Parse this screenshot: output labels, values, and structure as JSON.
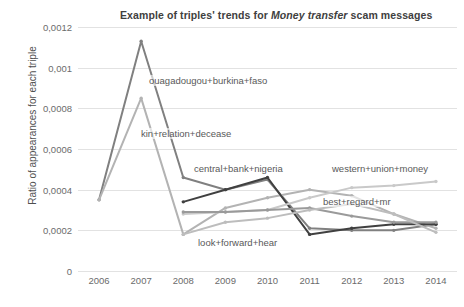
{
  "chart_data": {
    "type": "line",
    "title": "Example of triples' trends for Money transfer scam messages",
    "title_parts": {
      "before": "Example of triples' trends for ",
      "italic": "Money transfer",
      "after": " scam messages"
    },
    "xlabel": "",
    "ylabel": "Ratio of appearances for each triple",
    "categories": [
      "2006",
      "2007",
      "2008",
      "2009",
      "2010",
      "2011",
      "2012",
      "2013",
      "2014"
    ],
    "x": [
      2006,
      2007,
      2008,
      2009,
      2010,
      2011,
      2012,
      2013,
      2014
    ],
    "ylim": [
      0,
      0.0012
    ],
    "ytick_labels": [
      "0",
      "0,0002",
      "0,0004",
      "0,0006",
      "0,0008",
      "0,001",
      "0,0012"
    ],
    "ytick_values": [
      0,
      0.0002,
      0.0004,
      0.0006,
      0.0008,
      0.001,
      0.0012
    ],
    "grid": true,
    "legend_position": "inline-annotations",
    "decimal_separator": ",",
    "series": [
      {
        "name": "ouagadougou+burkina+faso",
        "color": "#808080",
        "label_x": 148,
        "label_y": 75,
        "values": [
          0.00035,
          0.00113,
          0.00046,
          0.0004,
          0.00045,
          0.00021,
          0.0002,
          0.0002,
          0.00023
        ]
      },
      {
        "name": "kin+relation+decease",
        "color": "#b3b3b3",
        "label_x": 140,
        "label_y": 128,
        "values": [
          0.00035,
          0.00085,
          0.00018,
          0.00031,
          0.00036,
          0.0004,
          0.00037,
          0.00028,
          0.00021
        ]
      },
      {
        "name": "central+bank+nigeria",
        "color": "#404040",
        "label_x": 193,
        "label_y": 163,
        "values": [
          null,
          null,
          0.00034,
          0.0004,
          0.00046,
          0.00018,
          0.00021,
          0.00023,
          0.00023
        ]
      },
      {
        "name": "western+union+money",
        "color": "#c9c9c9",
        "label_x": 331,
        "label_y": 163,
        "values": [
          null,
          null,
          0.00028,
          0.00029,
          0.0003,
          0.00036,
          0.00041,
          0.00042,
          0.00044
        ]
      },
      {
        "name": "best+regard+mr",
        "color": "#9a9a9a",
        "label_x": 322,
        "label_y": 196,
        "values": [
          null,
          null,
          0.00029,
          0.00029,
          0.0003,
          0.00031,
          0.00027,
          0.00024,
          0.00024
        ]
      },
      {
        "name": "look+forward+hear",
        "color": "#bdbdbd",
        "label_x": 197,
        "label_y": 237,
        "values": [
          null,
          null,
          0.00018,
          0.00024,
          0.00026,
          0.0003,
          0.00033,
          0.00028,
          0.00019
        ]
      }
    ]
  }
}
